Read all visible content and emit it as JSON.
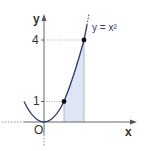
{
  "diagram": {
    "function_label": "y = x²",
    "axis_x_label": "x",
    "axis_y_label": "y",
    "origin_label": "O",
    "y_ticks": [
      {
        "value": 1,
        "label": "1"
      },
      {
        "value": 4,
        "label": "4"
      }
    ],
    "points": [
      {
        "x": 1,
        "y": 1
      },
      {
        "x": 2,
        "y": 4
      }
    ],
    "shaded_region": {
      "from_x": 1,
      "to_x": 2,
      "under": "y = x²"
    },
    "colors": {
      "curve": "#2b3a78",
      "shade": "#dde6f2",
      "axis": "#555555",
      "label": "#333333"
    }
  }
}
